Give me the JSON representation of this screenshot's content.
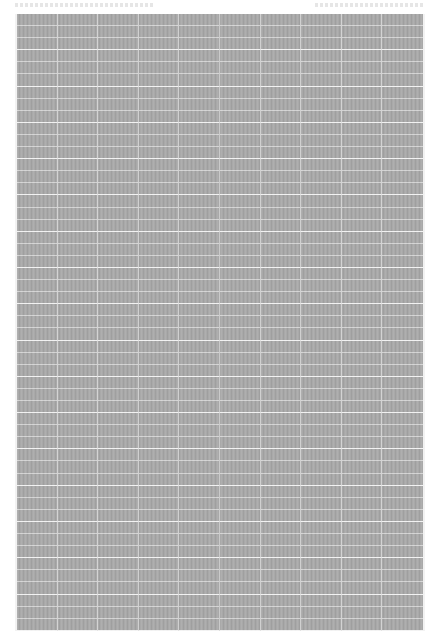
{
  "document": {
    "type": "scanned table / spreadsheet page",
    "header": {
      "left_text": "",
      "right_text": "",
      "legible": false
    },
    "table": {
      "legible": false,
      "column_count": 10,
      "row_count": 51,
      "background_color": "#a9a9a9",
      "gridline_color": "#f2f2f2",
      "cells_note": "text too small to read at this resolution"
    }
  }
}
